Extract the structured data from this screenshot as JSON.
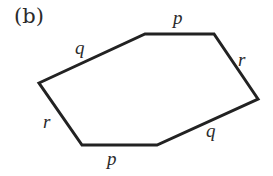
{
  "figure": {
    "panel_label": "(b)",
    "shape": "hexagon",
    "stroke_color": "#222222",
    "stroke_width": 3,
    "vertices": [
      {
        "name": "left",
        "x": 39,
        "y": 83
      },
      {
        "name": "top-left",
        "x": 145,
        "y": 34
      },
      {
        "name": "top-right",
        "x": 214,
        "y": 34
      },
      {
        "name": "right",
        "x": 258,
        "y": 99
      },
      {
        "name": "bottom-right",
        "x": 157,
        "y": 145
      },
      {
        "name": "bottom-left",
        "x": 82,
        "y": 145
      }
    ],
    "edges": [
      {
        "id": "upper-left",
        "label": "q"
      },
      {
        "id": "top",
        "label": "p"
      },
      {
        "id": "upper-right",
        "label": "r"
      },
      {
        "id": "lower-right",
        "label": "q"
      },
      {
        "id": "bottom",
        "label": "p"
      },
      {
        "id": "lower-left",
        "label": "r"
      }
    ]
  }
}
